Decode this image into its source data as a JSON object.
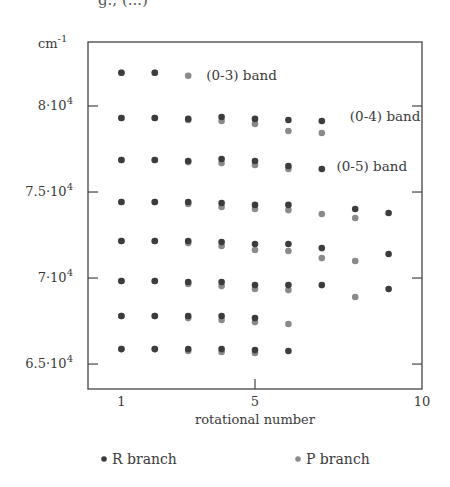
{
  "caption_fragment": "g., (...)",
  "chart_data": {
    "type": "scatter",
    "title": "",
    "xlabel": "rotational number",
    "ylabel": "cm-1",
    "xlim": [
      0,
      10
    ],
    "ylim": [
      63550,
      83720
    ],
    "x_ticks": [
      {
        "value": 1,
        "label": "1"
      },
      {
        "value": 5,
        "label": "5"
      },
      {
        "value": 10,
        "label": "10"
      }
    ],
    "y_ticks": [
      {
        "value": 65000,
        "label": "6.5·10",
        "exp": "4"
      },
      {
        "value": 70000,
        "label": "7·10",
        "exp": "4"
      },
      {
        "value": 75000,
        "label": "7.5·10",
        "exp": "4"
      },
      {
        "value": 80000,
        "label": "8·10",
        "exp": "4"
      }
    ],
    "grid": false,
    "legend_position": "bottom",
    "annotations": [
      {
        "text": "(0-3) band",
        "x": 3.3,
        "y": 81800
      },
      {
        "text": "(0-4) band",
        "x": 7.6,
        "y": 79400
      },
      {
        "text": "(0-5) band",
        "x": 7.2,
        "y": 76500
      }
    ],
    "series": [
      {
        "name": "R branch",
        "color": "#3c3c3c",
        "points": [
          [
            1,
            81930
          ],
          [
            2,
            81930
          ],
          [
            1,
            79300
          ],
          [
            2,
            79300
          ],
          [
            3,
            79250
          ],
          [
            4,
            79360
          ],
          [
            5,
            79250
          ],
          [
            6,
            79190
          ],
          [
            7,
            79130
          ],
          [
            1,
            76860
          ],
          [
            2,
            76860
          ],
          [
            3,
            76800
          ],
          [
            4,
            76920
          ],
          [
            5,
            76800
          ],
          [
            6,
            76510
          ],
          [
            7,
            76340
          ],
          [
            1,
            74420
          ],
          [
            2,
            74420
          ],
          [
            3,
            74420
          ],
          [
            4,
            74360
          ],
          [
            5,
            74250
          ],
          [
            6,
            74250
          ],
          [
            8,
            74010
          ],
          [
            9,
            73780
          ],
          [
            1,
            72150
          ],
          [
            2,
            72150
          ],
          [
            3,
            72150
          ],
          [
            4,
            72090
          ],
          [
            5,
            71980
          ],
          [
            6,
            71980
          ],
          [
            7,
            71740
          ],
          [
            9,
            71400
          ],
          [
            1,
            69830
          ],
          [
            2,
            69830
          ],
          [
            3,
            69770
          ],
          [
            4,
            69770
          ],
          [
            5,
            69590
          ],
          [
            6,
            69590
          ],
          [
            7,
            69590
          ],
          [
            9,
            69360
          ],
          [
            1,
            67790
          ],
          [
            2,
            67790
          ],
          [
            3,
            67790
          ],
          [
            4,
            67790
          ],
          [
            5,
            67670
          ],
          [
            1,
            65870
          ],
          [
            2,
            65870
          ],
          [
            3,
            65870
          ],
          [
            4,
            65870
          ],
          [
            5,
            65810
          ],
          [
            6,
            65760
          ]
        ]
      },
      {
        "name": "P branch",
        "color": "#8a8a8a",
        "points": [
          [
            1,
            81930
          ],
          [
            2,
            81930
          ],
          [
            3,
            81760
          ],
          [
            1,
            79300
          ],
          [
            2,
            79300
          ],
          [
            3,
            79190
          ],
          [
            4,
            79130
          ],
          [
            5,
            78960
          ],
          [
            6,
            78550
          ],
          [
            7,
            78430
          ],
          [
            1,
            76860
          ],
          [
            2,
            76860
          ],
          [
            3,
            76740
          ],
          [
            4,
            76680
          ],
          [
            5,
            76570
          ],
          [
            6,
            76340
          ],
          [
            1,
            74420
          ],
          [
            2,
            74420
          ],
          [
            3,
            74300
          ],
          [
            4,
            74130
          ],
          [
            5,
            74010
          ],
          [
            6,
            73950
          ],
          [
            7,
            73720
          ],
          [
            8,
            73490
          ],
          [
            1,
            72150
          ],
          [
            2,
            72150
          ],
          [
            3,
            72030
          ],
          [
            4,
            71860
          ],
          [
            5,
            71630
          ],
          [
            6,
            71570
          ],
          [
            7,
            71160
          ],
          [
            8,
            70990
          ],
          [
            1,
            69830
          ],
          [
            2,
            69830
          ],
          [
            3,
            69650
          ],
          [
            4,
            69530
          ],
          [
            5,
            69360
          ],
          [
            6,
            69300
          ],
          [
            8,
            68900
          ],
          [
            1,
            67790
          ],
          [
            2,
            67790
          ],
          [
            3,
            67670
          ],
          [
            4,
            67560
          ],
          [
            5,
            67440
          ],
          [
            6,
            67330
          ],
          [
            1,
            65870
          ],
          [
            2,
            65870
          ],
          [
            3,
            65760
          ],
          [
            4,
            65700
          ],
          [
            5,
            65640
          ]
        ]
      }
    ]
  },
  "legend": {
    "r_branch": "R branch",
    "p_branch": "P branch"
  }
}
